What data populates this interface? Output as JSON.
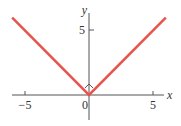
{
  "chart_data": {
    "type": "line",
    "title": "",
    "function": "y = |x|",
    "xlabel": "x",
    "ylabel": "y",
    "xlim": [
      -6,
      6
    ],
    "ylim": [
      -2,
      6
    ],
    "x_ticks": [
      -5,
      0,
      5
    ],
    "x_tick_labels": [
      "−5",
      "0",
      "5"
    ],
    "y_ticks": [
      5
    ],
    "y_tick_labels": [
      "5"
    ],
    "grid": false,
    "legend": null,
    "series": [
      {
        "name": "y = |x|",
        "color": "#e8544c",
        "x": [
          -6,
          0,
          6
        ],
        "y": [
          6,
          0,
          6
        ]
      }
    ],
    "annotations": [
      {
        "type": "corner-marker",
        "at": [
          0,
          0
        ],
        "note": "small angle mark at vertex"
      }
    ]
  },
  "colors": {
    "line": "#e8544c",
    "axis": "#555555",
    "text": "#333333"
  }
}
